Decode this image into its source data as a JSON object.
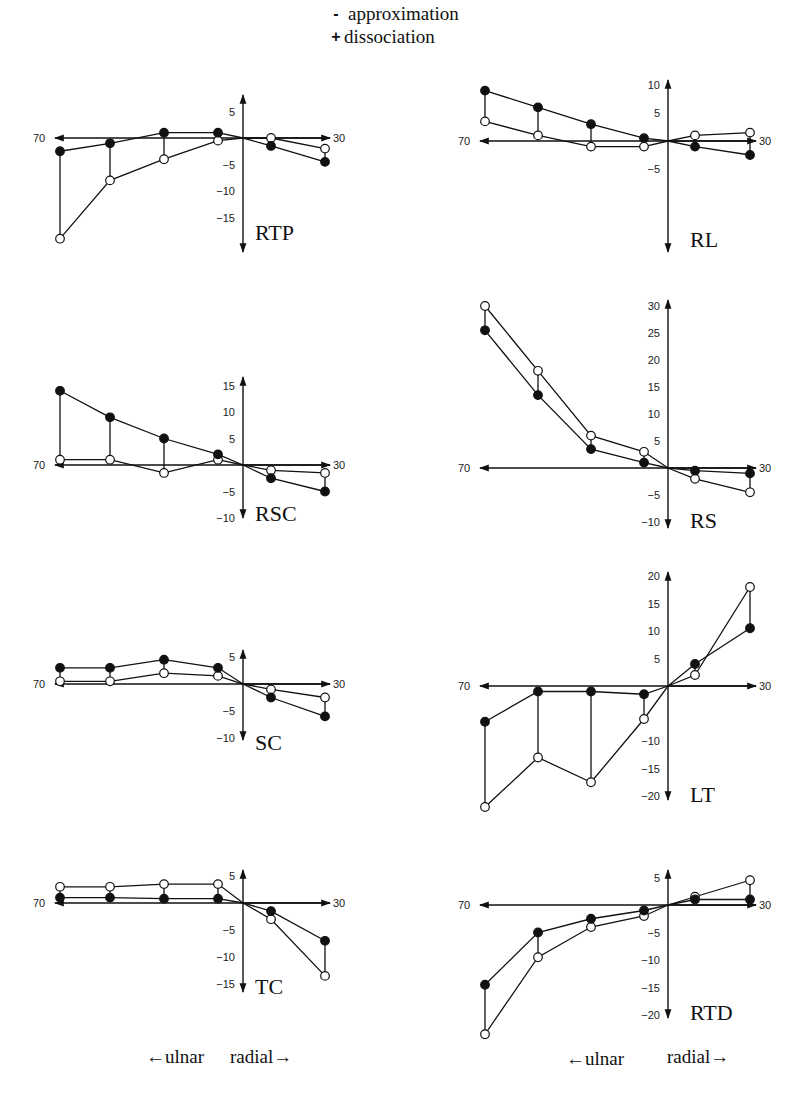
{
  "legend": {
    "items": [
      {
        "symbol": "-",
        "label": "approximation"
      },
      {
        "symbol": "+",
        "label": "dissociation"
      }
    ]
  },
  "direction_labels": {
    "left": {
      "ulnar": "ulnar",
      "radial": "radial"
    },
    "right": {
      "ulnar": "ulnar",
      "radial": "radial"
    }
  },
  "colors": {
    "line": "#111111",
    "open_fill": "#ffffff",
    "filled": "#111111"
  },
  "chart_data": [
    {
      "type": "line",
      "title": "RTP",
      "x_positions": [
        "-70",
        "-55",
        "-40",
        "-25",
        "0",
        "15",
        "30"
      ],
      "x_axis_labels": {
        "left": "70",
        "right": "30"
      },
      "yticks": [
        5,
        -5,
        -10,
        -15
      ],
      "ylim": [
        -20,
        7
      ],
      "series": [
        {
          "name": "approximation",
          "marker": "open",
          "values": [
            -19,
            -8,
            -4,
            -0.5,
            0,
            0,
            -2
          ]
        },
        {
          "name": "dissociation",
          "marker": "filled",
          "values": [
            -2.5,
            -1,
            1,
            1,
            0,
            -1.5,
            -4.5
          ]
        }
      ]
    },
    {
      "type": "line",
      "title": "RL",
      "x_positions": [
        "-70",
        "-55",
        "-40",
        "-25",
        "0",
        "15",
        "30"
      ],
      "x_axis_labels": {
        "left": "70",
        "right": "30"
      },
      "yticks": [
        10,
        5,
        -5
      ],
      "ylim": [
        -20,
        11
      ],
      "series": [
        {
          "name": "approximation",
          "marker": "open",
          "values": [
            3.5,
            1,
            -1,
            -1,
            0,
            1,
            1.5
          ]
        },
        {
          "name": "dissociation",
          "marker": "filled",
          "values": [
            9,
            6,
            3,
            0.5,
            0,
            -1,
            -2.5
          ]
        }
      ]
    },
    {
      "type": "line",
      "title": "RSC",
      "x_positions": [
        "-70",
        "-55",
        "-40",
        "-25",
        "0",
        "15",
        "30"
      ],
      "x_axis_labels": {
        "left": "70",
        "right": "30"
      },
      "yticks": [
        15,
        10,
        5,
        -5,
        -10
      ],
      "ylim": [
        -10,
        16
      ],
      "series": [
        {
          "name": "approximation",
          "marker": "open",
          "values": [
            1,
            1,
            -1.5,
            1,
            0,
            -1,
            -1.5
          ]
        },
        {
          "name": "dissociation",
          "marker": "filled",
          "values": [
            14,
            9,
            5,
            2,
            0,
            -2.5,
            -5
          ]
        }
      ]
    },
    {
      "type": "line",
      "title": "RS",
      "x_positions": [
        "-70",
        "-55",
        "-40",
        "-25",
        "0",
        "15",
        "30"
      ],
      "x_axis_labels": {
        "left": "70",
        "right": "30"
      },
      "yticks": [
        30,
        25,
        20,
        15,
        10,
        5,
        -5,
        -10
      ],
      "ylim": [
        -10,
        31
      ],
      "series": [
        {
          "name": "approximation",
          "marker": "open",
          "values": [
            30,
            18,
            6,
            3,
            0,
            -2,
            -4.5
          ]
        },
        {
          "name": "dissociation",
          "marker": "filled",
          "values": [
            25.5,
            13.5,
            3.5,
            1,
            0,
            -0.5,
            -1
          ]
        }
      ]
    },
    {
      "type": "line",
      "title": "SC",
      "x_positions": [
        "-70",
        "-55",
        "-40",
        "-25",
        "0",
        "15",
        "30"
      ],
      "x_axis_labels": {
        "left": "70",
        "right": "30"
      },
      "yticks": [
        5,
        -5,
        -10
      ],
      "ylim": [
        -10,
        6
      ],
      "series": [
        {
          "name": "approximation",
          "marker": "open",
          "values": [
            0.5,
            0.5,
            2,
            1.5,
            0,
            -1,
            -2.5
          ]
        },
        {
          "name": "dissociation",
          "marker": "filled",
          "values": [
            3,
            3,
            4.5,
            3,
            0,
            -2.5,
            -6
          ]
        }
      ]
    },
    {
      "type": "line",
      "title": "LT",
      "x_positions": [
        "-70",
        "-55",
        "-40",
        "-25",
        "0",
        "15",
        "30"
      ],
      "x_axis_labels": {
        "left": "70",
        "right": "30"
      },
      "yticks": [
        20,
        15,
        10,
        5,
        -10,
        -15,
        -20
      ],
      "ylim": [
        -20,
        20
      ],
      "series": [
        {
          "name": "approximation",
          "marker": "open",
          "values": [
            -22,
            -13,
            -17.5,
            -6,
            0,
            2,
            18
          ]
        },
        {
          "name": "dissociation",
          "marker": "filled",
          "values": [
            -6.5,
            -1,
            -1,
            -1.5,
            0,
            4,
            10.5
          ]
        }
      ]
    },
    {
      "type": "line",
      "title": "TC",
      "x_positions": [
        "-70",
        "-55",
        "-40",
        "-25",
        "0",
        "15",
        "30"
      ],
      "x_axis_labels": {
        "left": "70",
        "right": "30"
      },
      "yticks": [
        5,
        -5,
        -10,
        -15
      ],
      "ylim": [
        -15,
        6
      ],
      "series": [
        {
          "name": "approximation",
          "marker": "open",
          "values": [
            3,
            3,
            3.5,
            3.5,
            0,
            -3,
            -13.5
          ]
        },
        {
          "name": "dissociation",
          "marker": "filled",
          "values": [
            1,
            1,
            0.8,
            0.8,
            0,
            -1.5,
            -7
          ]
        }
      ]
    },
    {
      "type": "line",
      "title": "RTD",
      "x_positions": [
        "-70",
        "-55",
        "-40",
        "-25",
        "0",
        "15",
        "30"
      ],
      "x_axis_labels": {
        "left": "70",
        "right": "30"
      },
      "yticks": [
        5,
        -5,
        -10,
        -15,
        -20
      ],
      "ylim": [
        -20,
        6
      ],
      "series": [
        {
          "name": "approximation",
          "marker": "open",
          "values": [
            -23.5,
            -9.5,
            -4,
            -2,
            0,
            1.5,
            4.5
          ]
        },
        {
          "name": "dissociation",
          "marker": "filled",
          "values": [
            -14.5,
            -5,
            -2.5,
            -1,
            0,
            1,
            1
          ]
        }
      ]
    }
  ]
}
